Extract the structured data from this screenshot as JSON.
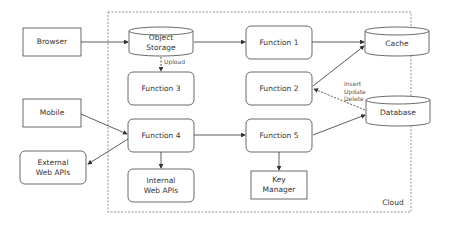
{
  "diagram": {
    "cloud_label": "Cloud",
    "nodes": {
      "browser": "Browser",
      "mobile": "Mobile",
      "external_web_apis": "External\nWeb APIs",
      "object_storage": "Object\nStorage",
      "function1": "Function 1",
      "function2": "Function 2",
      "function3": "Function 3",
      "function4": "Function 4",
      "function5": "Function 5",
      "internal_web_apis": "Internal\nWeb APIs",
      "key_manager": "Key\nManager",
      "cache": "Cache",
      "database": "Database"
    },
    "edge_labels": {
      "upload": "Upload",
      "insert_update_delete": "Insert\nUpdate\nDelete"
    },
    "edges": [
      {
        "from": "Browser",
        "to": "Object Storage"
      },
      {
        "from": "Object Storage",
        "to": "Function 1"
      },
      {
        "from": "Object Storage",
        "to": "Function 3",
        "label": "Upload",
        "style": "dashed"
      },
      {
        "from": "Function 1",
        "to": "Cache"
      },
      {
        "from": "Function 2",
        "to": "Cache"
      },
      {
        "from": "Database",
        "to": "Function 2",
        "label": "Insert Update Delete",
        "style": "dashed"
      },
      {
        "from": "Mobile",
        "to": "Function 4"
      },
      {
        "from": "Function 4",
        "to": "External Web APIs"
      },
      {
        "from": "Function 4",
        "to": "Function 5"
      },
      {
        "from": "Function 4",
        "to": "Internal Web APIs"
      },
      {
        "from": "Function 5",
        "to": "Database"
      },
      {
        "from": "Function 5",
        "to": "Key Manager"
      }
    ]
  }
}
